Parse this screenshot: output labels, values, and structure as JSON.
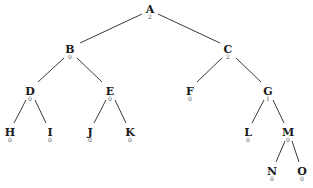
{
  "diagram": {
    "type": "binary-tree",
    "nodes": [
      {
        "id": "A",
        "label": "A",
        "value": "2",
        "x": 150,
        "y": 4
      },
      {
        "id": "B",
        "label": "B",
        "value": "0",
        "x": 70,
        "y": 44
      },
      {
        "id": "C",
        "label": "C",
        "value": "2",
        "x": 228,
        "y": 44
      },
      {
        "id": "D",
        "label": "D",
        "value": "0",
        "x": 30,
        "y": 86
      },
      {
        "id": "E",
        "label": "E",
        "value": "0",
        "x": 110,
        "y": 86
      },
      {
        "id": "F",
        "label": "F",
        "value": "0",
        "x": 190,
        "y": 86
      },
      {
        "id": "G",
        "label": "G",
        "value": "1",
        "x": 268,
        "y": 86
      },
      {
        "id": "H",
        "label": "H",
        "value": "0",
        "x": 10,
        "y": 127
      },
      {
        "id": "I",
        "label": "I",
        "value": "0",
        "x": 50,
        "y": 127
      },
      {
        "id": "J",
        "label": "J",
        "value": "0",
        "x": 90,
        "y": 127
      },
      {
        "id": "K",
        "label": "K",
        "value": "0",
        "x": 130,
        "y": 127
      },
      {
        "id": "L",
        "label": "L",
        "value": "0",
        "x": 248,
        "y": 127
      },
      {
        "id": "M",
        "label": "M",
        "value": "0",
        "x": 288,
        "y": 127
      },
      {
        "id": "N",
        "label": "N",
        "value": "0",
        "x": 272,
        "y": 166
      },
      {
        "id": "O",
        "label": "O",
        "value": "0",
        "x": 302,
        "y": 166
      }
    ],
    "edges": [
      {
        "from": "A",
        "to": "B",
        "x1": 142,
        "y1": 14,
        "x2": 80,
        "y2": 43
      },
      {
        "from": "A",
        "to": "C",
        "x1": 158,
        "y1": 14,
        "x2": 220,
        "y2": 43
      },
      {
        "from": "B",
        "to": "D",
        "x1": 64,
        "y1": 58,
        "x2": 38,
        "y2": 82
      },
      {
        "from": "B",
        "to": "E",
        "x1": 77,
        "y1": 58,
        "x2": 102,
        "y2": 82
      },
      {
        "from": "C",
        "to": "F",
        "x1": 222,
        "y1": 58,
        "x2": 197,
        "y2": 82
      },
      {
        "from": "C",
        "to": "G",
        "x1": 236,
        "y1": 58,
        "x2": 261,
        "y2": 82
      },
      {
        "from": "D",
        "to": "H",
        "x1": 26,
        "y1": 100,
        "x2": 14,
        "y2": 123
      },
      {
        "from": "D",
        "to": "I",
        "x1": 35,
        "y1": 100,
        "x2": 46,
        "y2": 123
      },
      {
        "from": "E",
        "to": "J",
        "x1": 106,
        "y1": 100,
        "x2": 94,
        "y2": 123
      },
      {
        "from": "E",
        "to": "K",
        "x1": 115,
        "y1": 100,
        "x2": 126,
        "y2": 123
      },
      {
        "from": "G",
        "to": "L",
        "x1": 264,
        "y1": 100,
        "x2": 252,
        "y2": 123
      },
      {
        "from": "G",
        "to": "M",
        "x1": 273,
        "y1": 100,
        "x2": 284,
        "y2": 123
      },
      {
        "from": "M",
        "to": "N",
        "x1": 285,
        "y1": 141,
        "x2": 276,
        "y2": 162
      },
      {
        "from": "M",
        "to": "O",
        "x1": 292,
        "y1": 141,
        "x2": 299,
        "y2": 162
      }
    ]
  }
}
